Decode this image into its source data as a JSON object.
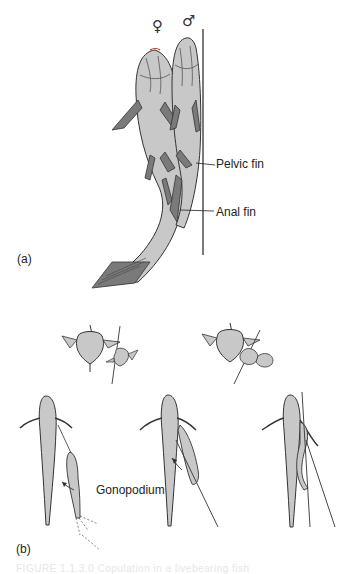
{
  "figure": {
    "panel_a": {
      "label": "(a)",
      "female_symbol": "♀",
      "male_symbol": "♂",
      "annotations": [
        {
          "text": "Pelvic fin"
        },
        {
          "text": "Anal fin"
        }
      ]
    },
    "panel_b": {
      "label": "(b)",
      "annotations": [
        {
          "text": "Gonopodium"
        }
      ]
    },
    "caption": "FIGURE 1.1.3.0 Copulation in a livebearing fish"
  },
  "colors": {
    "fish_fill": "#c8c8c8",
    "fish_stroke": "#333333",
    "fin_fill": "#7a7a7a",
    "line": "#222222",
    "accent_red": "#c0392b"
  }
}
